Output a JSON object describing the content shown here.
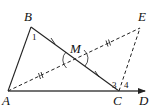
{
  "figure": {
    "type": "geometry",
    "points": {
      "A": {
        "label": "A",
        "x": 8,
        "y": 91
      },
      "B": {
        "label": "B",
        "x": 31,
        "y": 27
      },
      "C": {
        "label": "C",
        "x": 119,
        "y": 91
      },
      "D": {
        "label": "D",
        "x": 146,
        "y": 91
      },
      "E": {
        "label": "E",
        "x": 140,
        "y": 28
      },
      "M": {
        "label": "M",
        "x": 75,
        "y": 59
      }
    },
    "segments": [
      {
        "from": "A",
        "to": "B",
        "style": "solid"
      },
      {
        "from": "B",
        "to": "C",
        "style": "solid"
      },
      {
        "from": "A",
        "to": "C",
        "style": "solid"
      },
      {
        "from": "C",
        "to": "D",
        "style": "ray-arrow"
      },
      {
        "from": "A",
        "to": "E",
        "style": "dashed"
      },
      {
        "from": "C",
        "to": "E",
        "style": "dashed"
      }
    ],
    "equal_marks": {
      "single_tick": [
        "BM",
        "MC"
      ],
      "double_tick": [
        "AM",
        "ME"
      ]
    },
    "angles": [
      {
        "label": "1",
        "vertex": "B"
      },
      {
        "label": "2",
        "vertex": "M"
      },
      {
        "label": "3",
        "vertex": "C"
      },
      {
        "label": "4",
        "vertex": "C"
      }
    ],
    "stroke_color": "#222222",
    "background": "#ffffff"
  }
}
